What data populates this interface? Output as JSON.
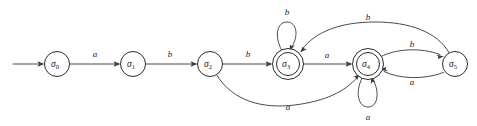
{
  "diagram": {
    "type": "finite-state-automaton",
    "title": "",
    "canvas": {
      "width": 477,
      "height": 126
    },
    "colors": {
      "background": "#ffffff",
      "node_stroke": "#2b2b2b",
      "edge_stroke": "#4a4a4a",
      "arrowhead": "#3a3a3a",
      "label_text": "#1c1c1c"
    },
    "start_marker": {
      "name": "start-arrow",
      "from_x": 13,
      "to_x": 44,
      "y": 64
    },
    "states": [
      {
        "id": "s0",
        "label": "σ",
        "subscript": "0",
        "cx": 57,
        "cy": 64,
        "r": 12.5,
        "accepting": false,
        "initial": true
      },
      {
        "id": "s1",
        "label": "σ",
        "subscript": "1",
        "cx": 133,
        "cy": 64,
        "r": 12.5,
        "accepting": false,
        "initial": false
      },
      {
        "id": "s2",
        "label": "σ",
        "subscript": "2",
        "cx": 210,
        "cy": 64,
        "r": 12.5,
        "accepting": false,
        "initial": false
      },
      {
        "id": "s3",
        "label": "σ",
        "subscript": "3",
        "cx": 288,
        "cy": 64,
        "r": 15.5,
        "inner_r": 11.5,
        "accepting": true,
        "initial": false
      },
      {
        "id": "s4",
        "label": "σ",
        "subscript": "4",
        "cx": 368,
        "cy": 64,
        "r": 15.5,
        "inner_r": 11.5,
        "accepting": true,
        "initial": false
      },
      {
        "id": "s5",
        "label": "σ",
        "subscript": "5",
        "cx": 455,
        "cy": 64,
        "r": 12.5,
        "accepting": false,
        "initial": false
      }
    ],
    "transitions": [
      {
        "id": "t0",
        "from": "s0",
        "to": "s1",
        "symbol": "a",
        "shape": "straight",
        "label_x": 95,
        "label_y": 55
      },
      {
        "id": "t1",
        "from": "s1",
        "to": "s2",
        "symbol": "b",
        "shape": "straight",
        "label_x": 170,
        "label_y": 55
      },
      {
        "id": "t2",
        "from": "s2",
        "to": "s3",
        "symbol": "b",
        "shape": "straight",
        "label_x": 248,
        "label_y": 55
      },
      {
        "id": "t3",
        "from": "s3",
        "to": "s4",
        "symbol": "a",
        "shape": "straight",
        "label_x": 327,
        "label_y": 56
      },
      {
        "id": "t4",
        "from": "s3",
        "to": "s3",
        "symbol": "b",
        "shape": "self-loop-top",
        "label_x": 287,
        "label_y": 13
      },
      {
        "id": "t5",
        "from": "s4",
        "to": "s4",
        "symbol": "a",
        "shape": "self-loop-bottom",
        "label_x": 368,
        "label_y": 118
      },
      {
        "id": "t6",
        "from": "s2",
        "to": "s4",
        "symbol": "a",
        "shape": "arc-below",
        "label_x": 288,
        "label_y": 108
      },
      {
        "id": "t7",
        "from": "s5",
        "to": "s3",
        "symbol": "b",
        "shape": "arc-above-long",
        "label_x": 368,
        "label_y": 18
      },
      {
        "id": "t8",
        "from": "s4",
        "to": "s5",
        "symbol": "b",
        "shape": "arc-above-short",
        "label_x": 412,
        "label_y": 45
      },
      {
        "id": "t9",
        "from": "s5",
        "to": "s4",
        "symbol": "a",
        "shape": "arc-below-short",
        "label_x": 412,
        "label_y": 83
      }
    ]
  }
}
